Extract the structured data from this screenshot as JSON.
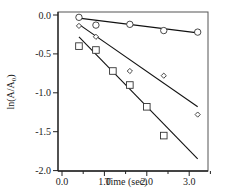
{
  "chart_data": {
    "type": "scatter",
    "title": "",
    "xlabel": "Time (sec)",
    "ylabel": "ln(A/A0)",
    "ylabel_main": "ln(A/A",
    "ylabel_sub": "0",
    "ylabel_close": ")",
    "xlim": [
      0.0,
      3.5
    ],
    "ylim": [
      -2.1,
      0.1
    ],
    "x_ticks": [
      0.0,
      1.0,
      2.0,
      3.0
    ],
    "x_tick_labels": [
      "0.0",
      "1.0",
      "2.0",
      "3.0"
    ],
    "y_ticks": [
      0.0,
      -0.5,
      -1.0,
      -1.5,
      -2.0
    ],
    "y_tick_labels": [
      "0.0",
      "-0.5",
      "-1.0",
      "-1.5",
      "-2.0"
    ],
    "grid": false,
    "legend": null,
    "series": [
      {
        "name": "circles",
        "marker": "circle",
        "x": [
          0.4,
          0.8,
          1.6,
          2.4,
          3.2
        ],
        "y": [
          -0.03,
          -0.13,
          -0.12,
          -0.2,
          -0.22
        ],
        "fit": {
          "x0": 0.4,
          "y0": -0.04,
          "x1": 3.2,
          "y1": -0.23
        }
      },
      {
        "name": "diamonds",
        "marker": "diamond",
        "x": [
          0.4,
          0.8,
          1.6,
          2.4,
          3.2
        ],
        "y": [
          -0.14,
          -0.28,
          -0.72,
          -0.78,
          -1.28
        ],
        "fit": {
          "x0": 0.4,
          "y0": -0.12,
          "x1": 3.2,
          "y1": -1.18
        }
      },
      {
        "name": "squares",
        "marker": "square",
        "x": [
          0.4,
          0.8,
          1.2,
          1.6,
          2.0,
          2.4
        ],
        "y": [
          -0.4,
          -0.45,
          -0.72,
          -0.9,
          -1.18,
          -1.55
        ],
        "fit": {
          "x0": 0.4,
          "y0": -0.28,
          "x1": 3.2,
          "y1": -1.85
        }
      }
    ]
  }
}
